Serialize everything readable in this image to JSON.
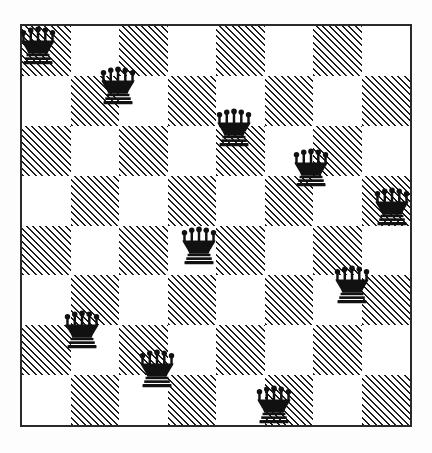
{
  "board": {
    "title": "Eight queens style chess diagram",
    "columns": 8,
    "rows": 8,
    "square_size_px": 48.5,
    "origin_x_px": 20,
    "origin_y_px": 24,
    "border_color": "#2a2a2a",
    "light_square_color": "#ffffff",
    "dark_square_pattern": "diagonal-hatch-45deg",
    "dark_square_ink_color": "#1d1d1d",
    "piece_color": "#111111",
    "piece_type": "queen",
    "piece_count": 10
  },
  "chart_data": {
    "type": "scatter",
    "xlabel": "file (column index, 0 = leftmost)",
    "ylabel": "rank (row index, 0 = topmost)",
    "xlim": [
      0,
      8
    ],
    "ylim": [
      0,
      8
    ],
    "grid": true,
    "legend": "none",
    "categories": [
      "a",
      "b",
      "c",
      "d",
      "e",
      "f",
      "g",
      "h"
    ],
    "row_labels": [
      "8",
      "7",
      "6",
      "5",
      "4",
      "3",
      "2",
      "1"
    ],
    "series": [
      {
        "name": "queens",
        "marker": "queen-glyph",
        "points": [
          {
            "col": 0,
            "row": 0,
            "square": "a8",
            "shade": "dark",
            "cx_px": 38,
            "cy_px": 45
          },
          {
            "col": 2,
            "row": 1,
            "square": "c7",
            "shade": "dark",
            "cx_px": 118,
            "cy_px": 85
          },
          {
            "col": 4,
            "row": 2,
            "square": "e6",
            "shade": "dark",
            "cx_px": 234,
            "cy_px": 127
          },
          {
            "col": 6,
            "row": 3,
            "square": "g5",
            "shade": "light",
            "cx_px": 311,
            "cy_px": 167
          },
          {
            "col": 7,
            "row": 4,
            "square": "h4",
            "shade": "dark",
            "cx_px": 392,
            "cy_px": 206
          },
          {
            "col": 3,
            "row": 4,
            "square": "d4",
            "shade": "light",
            "cx_px": 199,
            "cy_px": 245
          },
          {
            "col": 6,
            "row": 5,
            "square": "g3",
            "shade": "light",
            "cx_px": 352,
            "cy_px": 284
          },
          {
            "col": 1,
            "row": 6,
            "square": "b2",
            "shade": "light",
            "cx_px": 82,
            "cy_px": 329
          },
          {
            "col": 2,
            "row": 7,
            "square": "c1",
            "shade": "dark",
            "cx_px": 157,
            "cy_px": 368
          },
          {
            "col": 5,
            "row": 7,
            "square": "f1",
            "shade": "dark",
            "cx_px": 274,
            "cy_px": 404
          }
        ]
      }
    ]
  }
}
